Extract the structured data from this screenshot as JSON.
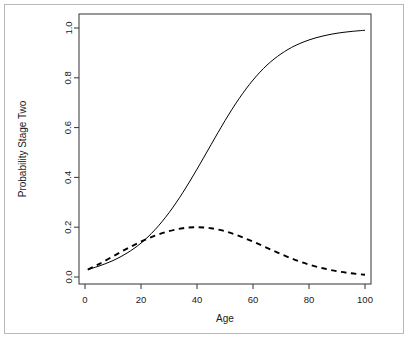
{
  "chart_data": {
    "type": "line",
    "title": "",
    "xlabel": "Age",
    "ylabel": "Probability Stage Two",
    "xlim": [
      0,
      100
    ],
    "ylim": [
      0.0,
      1.0
    ],
    "grid": false,
    "legend": "none",
    "xticks": [
      0,
      20,
      40,
      60,
      80,
      100
    ],
    "xticklabels": [
      "0",
      "20",
      "40",
      "60",
      "80",
      "100"
    ],
    "yticks": [
      0.0,
      0.2,
      0.4,
      0.6,
      0.8,
      1.0
    ],
    "yticklabels": [
      "0.0",
      "0.2",
      "0.4",
      "0.6",
      "0.8",
      "1.0"
    ],
    "x": [
      1,
      5,
      10,
      15,
      20,
      25,
      30,
      35,
      40,
      45,
      50,
      55,
      60,
      65,
      70,
      75,
      80,
      85,
      90,
      95,
      100
    ],
    "series": [
      {
        "name": "Cumulative probability",
        "style": "solid",
        "color": "#000000",
        "values": [
          0.03,
          0.044,
          0.066,
          0.096,
          0.136,
          0.19,
          0.258,
          0.34,
          0.433,
          0.531,
          0.628,
          0.716,
          0.791,
          0.851,
          0.896,
          0.929,
          0.952,
          0.968,
          0.979,
          0.986,
          0.991
        ]
      },
      {
        "name": "Density",
        "style": "dashed",
        "color": "#000000",
        "values": [
          0.03,
          0.052,
          0.083,
          0.114,
          0.142,
          0.166,
          0.184,
          0.196,
          0.2,
          0.196,
          0.184,
          0.165,
          0.142,
          0.117,
          0.092,
          0.069,
          0.05,
          0.035,
          0.023,
          0.015,
          0.009
        ]
      }
    ]
  },
  "axes": {
    "x_title": "Age",
    "y_title": "Probability Stage Two"
  }
}
